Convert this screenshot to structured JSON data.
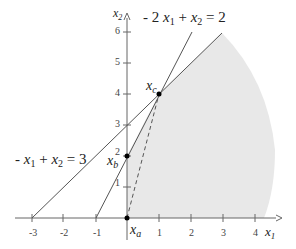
{
  "diagram": {
    "type": "linear-programming feasible region",
    "colors": {
      "region_fill": "#e8e8e8",
      "axis": "#666666",
      "line": "#555555",
      "point": "#000000",
      "text": "#222222"
    },
    "axes": {
      "x_label": "x",
      "x_sub": "1",
      "y_label": "x",
      "y_sub": "2",
      "x_ticks": [
        "-3",
        "-2",
        "-1",
        "1",
        "2",
        "3",
        "4"
      ],
      "y_ticks": [
        "1",
        "2",
        "3",
        "4",
        "5",
        "6"
      ]
    },
    "constraints": [
      {
        "id": "c1",
        "label": "- x1 + x2 = 3",
        "parts": [
          "- ",
          "x",
          "1",
          " + ",
          "x",
          "2",
          " = 3"
        ]
      },
      {
        "id": "c2",
        "label": "- 2 x1 + x2 = 2",
        "parts": [
          "- 2 ",
          "x",
          "1",
          " + ",
          "x",
          "2",
          " = 2"
        ]
      }
    ],
    "points": [
      {
        "name": "x",
        "sub": "a",
        "coords": [
          0,
          0
        ]
      },
      {
        "name": "x",
        "sub": "b",
        "coords": [
          0,
          2
        ]
      },
      {
        "name": "x",
        "sub": "c",
        "coords": [
          1,
          4
        ]
      }
    ],
    "dashed_segment": {
      "from": "x_a",
      "to": "x_c"
    }
  }
}
